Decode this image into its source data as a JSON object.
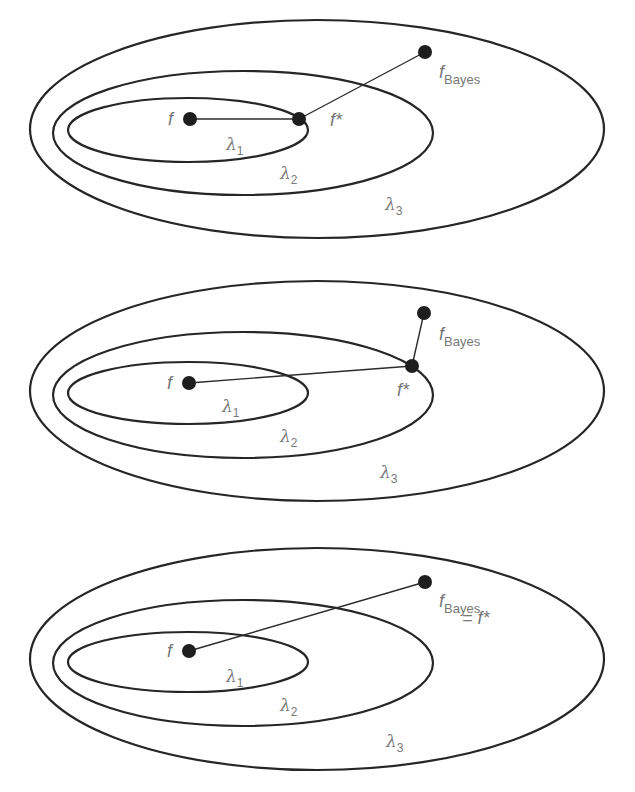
{
  "diagram": {
    "type": "nested hypothesis spaces (approximation vs. estimation error)",
    "colors": {
      "stroke": "#262626",
      "point": "#1e1e1e",
      "label": "#777777"
    },
    "panels": [
      {
        "id": "panel-1",
        "caption": "f* on boundary of lambda_1, f_Bayes outside lambda_2",
        "ellipses": [
          {
            "name": "lambda-3",
            "label": "λ",
            "sub": "3",
            "cx": 317,
            "cy": 129,
            "rx": 287,
            "ry": 109,
            "lx": 385,
            "ly": 210
          },
          {
            "name": "lambda-2",
            "label": "λ",
            "sub": "2",
            "cx": 243,
            "cy": 133,
            "rx": 190,
            "ry": 62,
            "lx": 280,
            "ly": 179
          },
          {
            "name": "lambda-1",
            "label": "λ",
            "sub": "1",
            "cx": 188,
            "cy": 130,
            "rx": 120,
            "ry": 32,
            "lx": 226,
            "ly": 150
          }
        ],
        "points": [
          {
            "name": "f",
            "x": 190,
            "y": 119,
            "text": "f",
            "tx": 168,
            "ty": 125
          },
          {
            "name": "f-star",
            "x": 299,
            "y": 119,
            "text": "f*",
            "tx": 330,
            "ty": 126
          },
          {
            "name": "f-bayes",
            "x": 425,
            "y": 52,
            "text": "f",
            "sub": "Bayes",
            "tx": 439,
            "ty": 78
          }
        ],
        "lines": [
          {
            "from": "f",
            "to": "f-star"
          },
          {
            "from": "f-star",
            "to": "f-bayes"
          }
        ]
      },
      {
        "id": "panel-2",
        "caption": "f* on boundary of lambda_2, f_Bayes outside lambda_2",
        "ellipses": [
          {
            "name": "lambda-3",
            "label": "λ",
            "sub": "3",
            "cx": 317,
            "cy": 391,
            "rx": 287,
            "ry": 110,
            "lx": 380,
            "ly": 478
          },
          {
            "name": "lambda-2",
            "label": "λ",
            "sub": "2",
            "cx": 243,
            "cy": 395,
            "rx": 190,
            "ry": 63,
            "lx": 280,
            "ly": 442
          },
          {
            "name": "lambda-1",
            "label": "λ",
            "sub": "1",
            "cx": 188,
            "cy": 393,
            "rx": 120,
            "ry": 31,
            "lx": 222,
            "ly": 412
          }
        ],
        "points": [
          {
            "name": "f",
            "x": 189,
            "y": 383,
            "text": "f",
            "tx": 167,
            "ty": 389
          },
          {
            "name": "f-star",
            "x": 412,
            "y": 366,
            "text": "f*",
            "tx": 397,
            "ty": 396
          },
          {
            "name": "f-bayes",
            "x": 424,
            "y": 313,
            "text": "f",
            "sub": "Bayes",
            "tx": 439,
            "ty": 340
          }
        ],
        "lines": [
          {
            "from": "f",
            "to": "f-star"
          },
          {
            "from": "f-star",
            "to": "f-bayes"
          }
        ]
      },
      {
        "id": "panel-3",
        "caption": "f_Bayes = f* inside lambda_3",
        "ellipses": [
          {
            "name": "lambda-3",
            "label": "λ",
            "sub": "3",
            "cx": 317,
            "cy": 659,
            "rx": 287,
            "ry": 111,
            "lx": 386,
            "ly": 747
          },
          {
            "name": "lambda-2",
            "label": "λ",
            "sub": "2",
            "cx": 243,
            "cy": 663,
            "rx": 190,
            "ry": 63,
            "lx": 280,
            "ly": 711
          },
          {
            "name": "lambda-1",
            "label": "λ",
            "sub": "1",
            "cx": 188,
            "cy": 662,
            "rx": 120,
            "ry": 30,
            "lx": 226,
            "ly": 682
          }
        ],
        "points": [
          {
            "name": "f",
            "x": 189,
            "y": 651,
            "text": "f",
            "tx": 167,
            "ty": 657
          },
          {
            "name": "f-bayes",
            "x": 425,
            "y": 582,
            "text": "f",
            "sub": "Bayes",
            "tx": 439,
            "ty": 607,
            "extra": "= f*",
            "ex": 462,
            "ey": 624
          }
        ],
        "lines": [
          {
            "from": "f",
            "to": "f-bayes"
          }
        ]
      }
    ]
  }
}
